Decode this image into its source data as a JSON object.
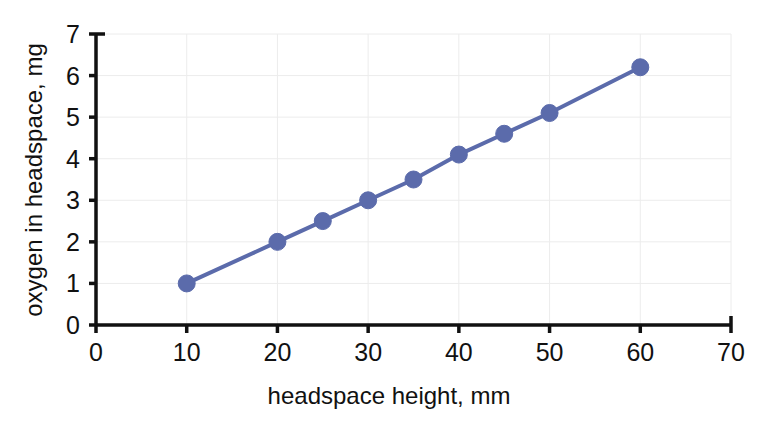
{
  "chart_data": {
    "type": "line",
    "title": "",
    "subtitle": "",
    "xlabel": "headspace height, mm",
    "ylabel": "oxygen in headspace, mg",
    "xlim": [
      0,
      70
    ],
    "ylim": [
      0,
      7
    ],
    "xticks": [
      "0",
      "10",
      "20",
      "30",
      "40",
      "50",
      "60",
      "70"
    ],
    "yticks": [
      "0",
      "1",
      "2",
      "3",
      "4",
      "5",
      "6",
      "7"
    ],
    "grid": true,
    "legend": false,
    "legend_position": "none",
    "marker": "circle",
    "series": [
      {
        "name": "oxygen in headspace",
        "color": "#5b6bab",
        "x": [
          10,
          20,
          25,
          30,
          35,
          40,
          45,
          50,
          60
        ],
        "values": [
          1.0,
          2.0,
          2.5,
          3.0,
          3.5,
          4.1,
          4.6,
          5.1,
          6.2
        ]
      }
    ],
    "points": [
      {
        "x": 10,
        "y": 1.0
      },
      {
        "x": 20,
        "y": 2.0
      },
      {
        "x": 25,
        "y": 2.5
      },
      {
        "x": 30,
        "y": 3.0
      },
      {
        "x": 35,
        "y": 3.5
      },
      {
        "x": 40,
        "y": 4.1
      },
      {
        "x": 45,
        "y": 4.6
      },
      {
        "x": 50,
        "y": 5.1
      },
      {
        "x": 60,
        "y": 6.2
      }
    ],
    "colors": {
      "series": "#5b6bab",
      "axis": "#111111",
      "grid": "#ececec",
      "background": "#ffffff"
    }
  }
}
